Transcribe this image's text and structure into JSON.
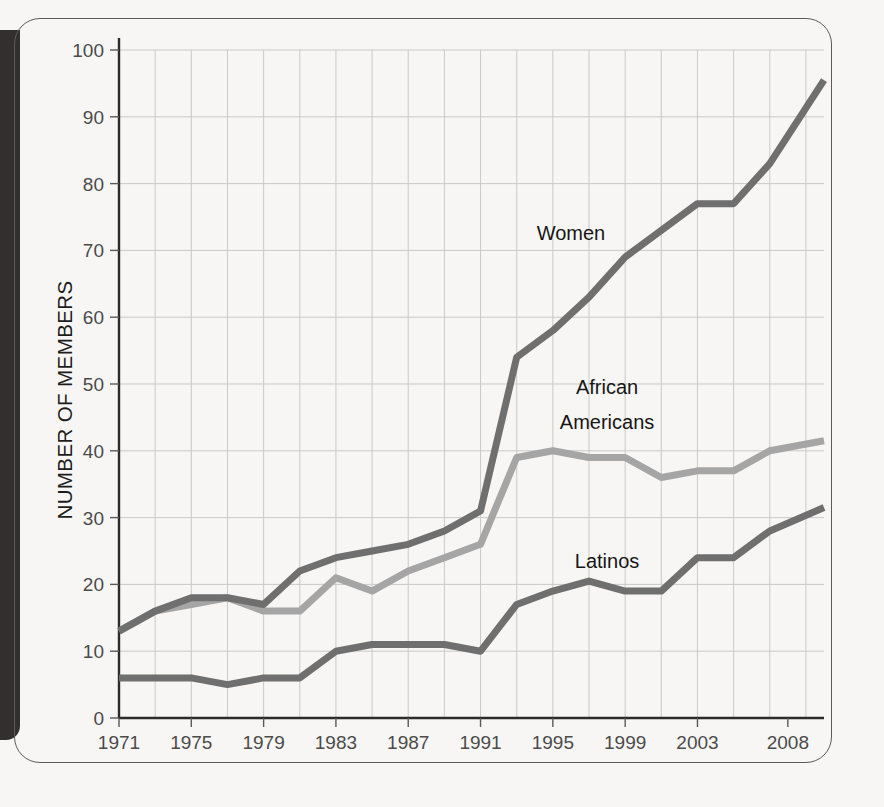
{
  "figure": {
    "y_axis_title": "NUMBER OF MEMBERS",
    "background_color": "#f7f6f4",
    "frame_color": "#5d5a57",
    "gutter_color": "#332f2e"
  },
  "labels": {
    "women": "Women",
    "african_americans_line1": "African",
    "african_americans_line2": "Americans",
    "latinos": "Latinos"
  },
  "chart_data": {
    "type": "line",
    "title": "",
    "xlabel": "",
    "ylabel": "NUMBER OF MEMBERS",
    "xlim": [
      1971,
      2010
    ],
    "ylim": [
      0,
      100
    ],
    "yticks": [
      0,
      10,
      20,
      30,
      40,
      50,
      60,
      70,
      80,
      90,
      100
    ],
    "xticks": [
      1971,
      1975,
      1979,
      1983,
      1987,
      1991,
      1995,
      1999,
      2003,
      2008
    ],
    "xtick_labels": [
      "1971",
      "1975",
      "1979",
      "1983",
      "1987",
      "1991",
      "1995",
      "1999",
      "2003",
      "2008"
    ],
    "x_gridlines": [
      1971,
      1973,
      1975,
      1977,
      1979,
      1981,
      1983,
      1985,
      1987,
      1989,
      1991,
      1993,
      1995,
      1997,
      1999,
      2001,
      2003,
      2005,
      2007,
      2009
    ],
    "grid": true,
    "legend_position": "inline-annotations",
    "x": [
      1971,
      1973,
      1975,
      1977,
      1979,
      1981,
      1983,
      1985,
      1987,
      1989,
      1991,
      1993,
      1995,
      1997,
      1999,
      2001,
      2003,
      2005,
      2007,
      2010
    ],
    "series": [
      {
        "name": "Women",
        "color": "#6f6f6f",
        "values": [
          13,
          16,
          18,
          18,
          17,
          22,
          24,
          25,
          26,
          28,
          31,
          54,
          58,
          63,
          69,
          73,
          77,
          77,
          83,
          95.5
        ],
        "label": "Women",
        "label_x": 1996,
        "label_y": 71.5
      },
      {
        "name": "African Americans",
        "color": "#a5a5a5",
        "values": [
          13,
          16,
          17,
          18,
          16,
          16,
          21,
          19,
          22,
          24,
          26,
          39,
          40,
          39,
          39,
          36,
          37,
          37,
          40,
          41.5
        ],
        "label": "African Americans",
        "label_x": 1998,
        "label_y": 48.5
      },
      {
        "name": "Latinos",
        "color": "#6f6f6f",
        "values": [
          6,
          6,
          6,
          5,
          6,
          6,
          10,
          11,
          11,
          11,
          10,
          17,
          19,
          20.5,
          19,
          19,
          24,
          24,
          28,
          31.5
        ],
        "label": "Latinos",
        "label_x": 1998,
        "label_y": 22.5
      }
    ]
  }
}
